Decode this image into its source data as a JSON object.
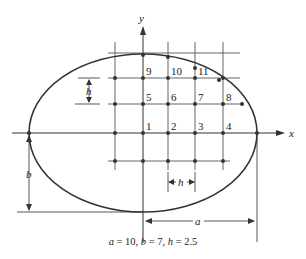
{
  "figure": {
    "caption": {
      "a_symbol": "a",
      "a_value": "10",
      "b_symbol": "b",
      "b_value": "7",
      "h_symbol": "h",
      "h_value": "2.5"
    },
    "axes": {
      "x_label": "x",
      "y_label": "y"
    },
    "dimensions": {
      "a_label": "a",
      "b_label": "b",
      "h_vertical_label": "h",
      "h_horizontal_label": "h"
    },
    "ellipse": {
      "semi_major_a": 10,
      "semi_minor_b": 7,
      "stroke": "#333333"
    },
    "grid": {
      "spacing_h": 2.5,
      "line_color": "#444444",
      "node_color": "#333333"
    },
    "nodes": [
      {
        "id": "1",
        "label": "1"
      },
      {
        "id": "2",
        "label": "2"
      },
      {
        "id": "3",
        "label": "3"
      },
      {
        "id": "4",
        "label": "4"
      },
      {
        "id": "5",
        "label": "5"
      },
      {
        "id": "6",
        "label": "6"
      },
      {
        "id": "7",
        "label": "7"
      },
      {
        "id": "8",
        "label": "8"
      },
      {
        "id": "9",
        "label": "9"
      },
      {
        "id": "10",
        "label": "10"
      },
      {
        "id": "11",
        "label": "11"
      }
    ]
  }
}
